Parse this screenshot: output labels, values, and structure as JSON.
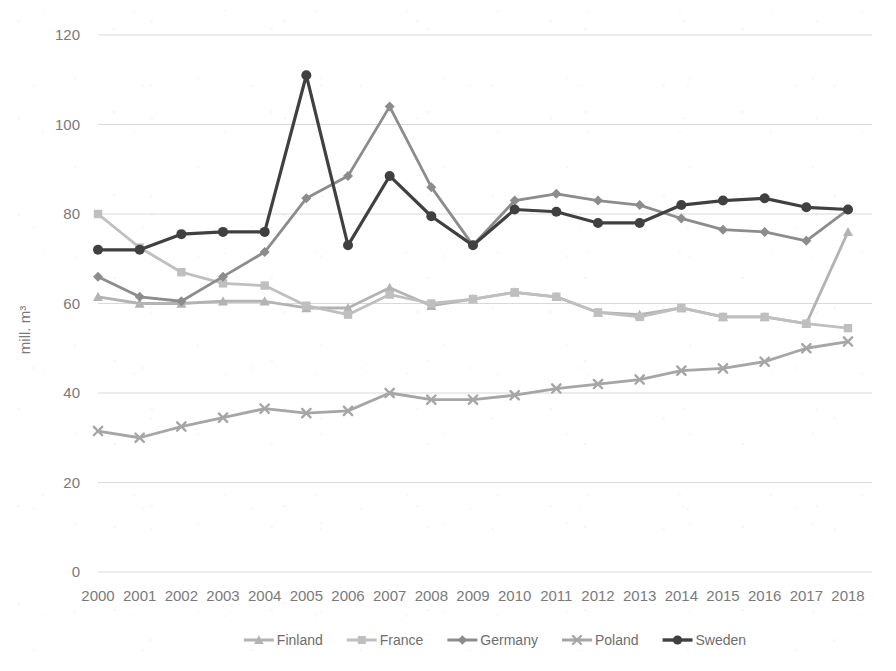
{
  "chart_data": {
    "type": "line",
    "title": "",
    "subtitle": "",
    "xlabel": "",
    "ylabel": "mill. m³",
    "categories": [
      "2000",
      "2001",
      "2002",
      "2003",
      "2004",
      "2005",
      "2006",
      "2007",
      "2008",
      "2009",
      "2010",
      "2011",
      "2012",
      "2013",
      "2014",
      "2015",
      "2016",
      "2017",
      "2018"
    ],
    "x": [
      2000,
      2001,
      2002,
      2003,
      2004,
      2005,
      2006,
      2007,
      2008,
      2009,
      2010,
      2011,
      2012,
      2013,
      2014,
      2015,
      2016,
      2017,
      2018
    ],
    "ylim": [
      0,
      120
    ],
    "yticks": [
      0,
      20,
      40,
      60,
      80,
      100,
      120
    ],
    "ytick_labels": [
      "0",
      "20",
      "40",
      "60",
      "80",
      "100",
      "120"
    ],
    "grid": "horizontal",
    "legend_position": "bottom",
    "series": [
      {
        "name": "Finland",
        "marker": "triangle",
        "color": "#b3b3b3",
        "values": [
          61.5,
          60.0,
          60.0,
          60.5,
          60.5,
          59.0,
          59.0,
          63.5,
          59.5,
          61.0,
          62.5,
          61.5,
          58.0,
          57.5,
          59.0,
          57.0,
          57.0,
          55.5,
          76.0
        ]
      },
      {
        "name": "France",
        "marker": "square",
        "color": "#bfbfbf",
        "values": [
          80.0,
          72.5,
          67.0,
          64.5,
          64.0,
          59.5,
          57.5,
          62.0,
          60.0,
          61.0,
          62.5,
          61.5,
          58.0,
          57.0,
          59.0,
          57.0,
          57.0,
          55.5,
          54.5
        ]
      },
      {
        "name": "Germany",
        "marker": "diamond",
        "color": "#8c8c8c",
        "values": [
          66.0,
          61.5,
          60.5,
          66.0,
          71.5,
          83.5,
          88.5,
          104.0,
          86.0,
          73.0,
          83.0,
          84.5,
          83.0,
          82.0,
          79.0,
          76.5,
          76.0,
          74.0,
          81.0
        ]
      },
      {
        "name": "Poland",
        "marker": "x",
        "color": "#a6a6a6",
        "values": [
          31.5,
          30.0,
          32.5,
          34.5,
          36.5,
          35.5,
          36.0,
          40.0,
          38.5,
          38.5,
          39.5,
          41.0,
          42.0,
          43.0,
          45.0,
          45.5,
          47.0,
          50.0,
          51.5
        ]
      },
      {
        "name": "Sweden",
        "marker": "circle",
        "color": "#404040",
        "values": [
          72.0,
          72.0,
          75.5,
          76.0,
          76.0,
          111.0,
          73.0,
          88.5,
          79.5,
          73.0,
          81.0,
          80.5,
          78.0,
          78.0,
          82.0,
          83.0,
          83.5,
          81.5,
          81.0
        ]
      }
    ]
  },
  "legend": {
    "items": [
      {
        "label": "Finland"
      },
      {
        "label": "France"
      },
      {
        "label": "Germany"
      },
      {
        "label": "Poland"
      },
      {
        "label": "Sweden"
      }
    ]
  },
  "colors": {
    "background": "#ffffff",
    "gridline": "#d9d9d9",
    "tick_text": "#7a7a7a",
    "legend_text": "#6e6e6e"
  }
}
